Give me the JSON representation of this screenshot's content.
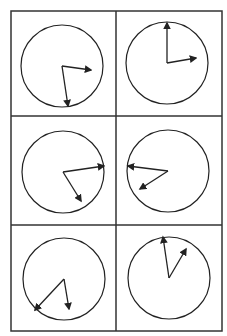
{
  "diagram": {
    "title": "",
    "grid": {
      "rows": 3,
      "cols": 2,
      "x": [
        11,
        116,
        222
      ],
      "y": [
        11,
        116,
        225,
        331
      ],
      "stroke": "#333333"
    },
    "clocks": [
      {
        "id": "clock-1",
        "cx": 62,
        "cy": 66,
        "r": 41,
        "long_hand": [
          68,
          106
        ],
        "short_hand": [
          91,
          70
        ]
      },
      {
        "id": "clock-2",
        "cx": 167,
        "cy": 63,
        "r": 41,
        "long_hand": [
          167,
          23
        ],
        "short_hand": [
          196,
          58
        ]
      },
      {
        "id": "clock-3",
        "cx": 63,
        "cy": 172,
        "r": 41,
        "long_hand": [
          104,
          166
        ],
        "short_hand": [
          81,
          201
        ]
      },
      {
        "id": "clock-4",
        "cx": 168,
        "cy": 171,
        "r": 41,
        "long_hand": [
          128,
          166
        ],
        "short_hand": [
          140,
          189
        ]
      },
      {
        "id": "clock-5",
        "cx": 64,
        "cy": 279,
        "r": 41,
        "long_hand": [
          35,
          310
        ],
        "short_hand": [
          69,
          309
        ]
      },
      {
        "id": "clock-6",
        "cx": 169,
        "cy": 278,
        "r": 41,
        "long_hand": [
          163,
          237
        ],
        "short_hand": [
          186,
          249
        ]
      }
    ],
    "colors": {
      "line": "#222222",
      "background": "#ffffff"
    }
  }
}
